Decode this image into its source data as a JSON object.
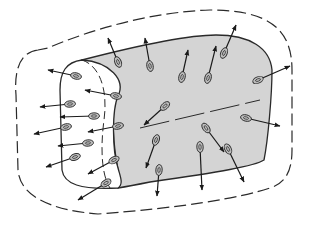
{
  "diagram": {
    "title": "",
    "colors": {
      "background": "#ffffff",
      "body_fill": "#d4d4d4",
      "end_face_fill": "#ffffff",
      "stroke": "#2a2a2a",
      "particle_fill": "#bdbdbd"
    },
    "labels": [],
    "particles": [
      {
        "x": 118,
        "y": 62,
        "ax": 108,
        "ay": 38
      },
      {
        "x": 150,
        "y": 66,
        "ax": 145,
        "ay": 38
      },
      {
        "x": 182,
        "y": 77,
        "ax": 188,
        "ay": 50
      },
      {
        "x": 224,
        "y": 53,
        "ax": 236,
        "ay": 25
      },
      {
        "x": 208,
        "y": 78,
        "ax": 216,
        "ay": 46
      },
      {
        "x": 258,
        "y": 80,
        "ax": 290,
        "ay": 66
      },
      {
        "x": 76,
        "y": 76,
        "ax": 48,
        "ay": 70
      },
      {
        "x": 116,
        "y": 96,
        "ax": 85,
        "ay": 90
      },
      {
        "x": 70,
        "y": 104,
        "ax": 40,
        "ay": 107
      },
      {
        "x": 94,
        "y": 116,
        "ax": 60,
        "ay": 117
      },
      {
        "x": 118,
        "y": 126,
        "ax": 88,
        "ay": 132
      },
      {
        "x": 66,
        "y": 127,
        "ax": 34,
        "ay": 134
      },
      {
        "x": 88,
        "y": 143,
        "ax": 58,
        "ay": 146
      },
      {
        "x": 75,
        "y": 157,
        "ax": 46,
        "ay": 167
      },
      {
        "x": 114,
        "y": 160,
        "ax": 88,
        "ay": 174
      },
      {
        "x": 106,
        "y": 183,
        "ax": 78,
        "ay": 200
      },
      {
        "x": 165,
        "y": 106,
        "ax": 144,
        "ay": 125
      },
      {
        "x": 206,
        "y": 128,
        "ax": 224,
        "ay": 152
      },
      {
        "x": 246,
        "y": 118,
        "ax": 280,
        "ay": 126
      },
      {
        "x": 156,
        "y": 140,
        "ax": 146,
        "ay": 168
      },
      {
        "x": 159,
        "y": 170,
        "ax": 157,
        "ay": 196
      },
      {
        "x": 200,
        "y": 147,
        "ax": 202,
        "ay": 190
      },
      {
        "x": 228,
        "y": 149,
        "ax": 244,
        "ay": 182
      }
    ]
  }
}
